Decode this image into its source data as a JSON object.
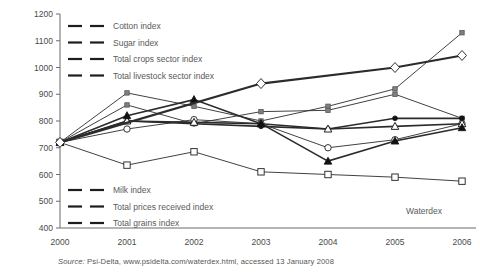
{
  "figure": {
    "source_prefix": "Source:",
    "source_text": "Psi-Delta, www.psidelta.com/waterdex.html, accessed 13 January 2008"
  },
  "legend_top": [
    {
      "label": "Cotton index",
      "marker": "open-square-marker"
    },
    {
      "label": "Sugar index",
      "marker": "small-filled-square-marker"
    },
    {
      "label": "Total crops sector index",
      "marker": "open-circle-marker"
    },
    {
      "label": "Total livestock sector index",
      "marker": "small-filled-square-marker"
    }
  ],
  "legend_bottom": [
    {
      "label": "Milk index",
      "marker": "filled-dot-marker"
    },
    {
      "label": "Total prices received index",
      "marker": "open-triangle-marker"
    },
    {
      "label": "Total grains index",
      "marker": "filled-triangle-marker"
    }
  ],
  "legend_right": [
    {
      "label": "Waterdex",
      "marker": "open-diamond-marker"
    }
  ],
  "chart_data": {
    "type": "line",
    "title": "",
    "xlabel": "",
    "ylabel": "",
    "x": [
      2000,
      2001,
      2002,
      2003,
      2004,
      2005,
      2006
    ],
    "xtick_labels": [
      "2000",
      "2001",
      "2002",
      "2003",
      "2004",
      "2005",
      "2006"
    ],
    "ylim": [
      400,
      1200
    ],
    "ytick_labels": [
      "400",
      "500",
      "600",
      "700",
      "800",
      "900",
      "1000",
      "1100",
      "1200"
    ],
    "yticks": [
      400,
      500,
      600,
      700,
      800,
      900,
      1000,
      1100,
      1200
    ],
    "grid": false,
    "legend_position": "inside-top-left-and-bottom-left",
    "series": [
      {
        "name": "Cotton index",
        "marker": "open-square",
        "width": 0.9,
        "values": [
          720,
          635,
          685,
          610,
          600,
          590,
          575
        ]
      },
      {
        "name": "Sugar index",
        "marker": "small-filled-square",
        "width": 0.9,
        "values": [
          720,
          905,
          855,
          800,
          855,
          920,
          1130
        ]
      },
      {
        "name": "Total crops sector index",
        "marker": "open-circle",
        "width": 0.9,
        "values": [
          720,
          770,
          805,
          790,
          700,
          730,
          790
        ]
      },
      {
        "name": "Total livestock sector index",
        "marker": "small-filled-square",
        "width": 0.9,
        "values": [
          720,
          860,
          790,
          835,
          840,
          900,
          810
        ]
      },
      {
        "name": "Milk index",
        "marker": "filled-dot",
        "width": 1.6,
        "values": [
          720,
          800,
          790,
          780,
          770,
          810,
          810
        ]
      },
      {
        "name": "Total prices received index",
        "marker": "open-triangle",
        "width": 1.6,
        "values": [
          720,
          800,
          795,
          790,
          770,
          780,
          790
        ]
      },
      {
        "name": "Total grains index",
        "marker": "filled-triangle",
        "width": 1.6,
        "values": [
          720,
          820,
          880,
          790,
          650,
          725,
          775
        ]
      },
      {
        "name": "Waterdex",
        "marker": "open-diamond",
        "width": 2.2,
        "values": [
          720,
          null,
          null,
          940,
          null,
          1000,
          1045
        ],
        "note": "thick rising line from 2000 to 2006 with diamond markers"
      }
    ]
  }
}
